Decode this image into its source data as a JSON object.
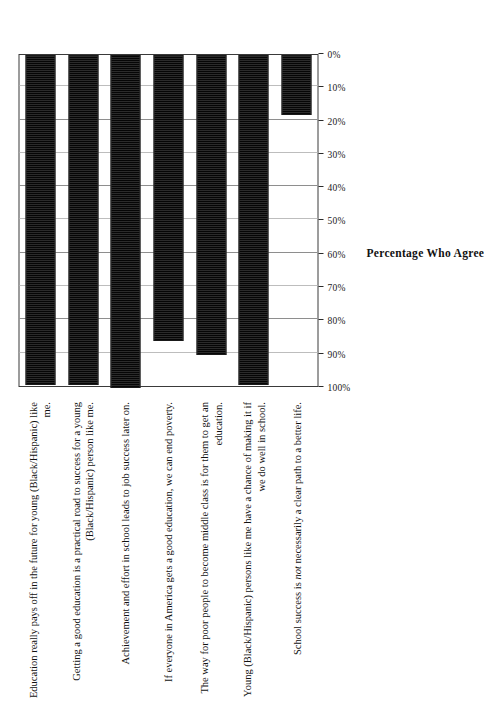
{
  "chart_data": {
    "type": "bar",
    "orientation": "vertical-rotated",
    "title": "",
    "xlabel": "",
    "ylabel": "Percentage Who Agree",
    "ylim": [
      0,
      100
    ],
    "grid": true,
    "legend": "none",
    "tick_labels": [
      "0%",
      "10%",
      "20%",
      "30%",
      "40%",
      "50%",
      "60%",
      "70%",
      "80%",
      "90%",
      "100%"
    ],
    "tick_values": [
      0,
      10,
      20,
      30,
      40,
      50,
      60,
      70,
      80,
      90,
      100
    ],
    "categories": [
      "Education really pays off in the future for young (Black/Hispanic) like me.",
      "Getting a good education is a practical road to success for a young (Black/Hispanic) person like me.",
      "Achievement and effort in school leads to job success later on.",
      "If everyone in America gets a good education, we can end poverty.",
      "The way for poor people to become middle class is for them to get an education.",
      "Young (Black/Hispanic) persons like me have a chance of making it if we do well in school.",
      "School success is not necessarily a clear path to a better life."
    ],
    "values": [
      99,
      99,
      100,
      86,
      90,
      99,
      18
    ],
    "bar_color": "#4a4a4a",
    "bar_edge_color": "#1a1a1a"
  },
  "axis": {
    "title": "Percentage Who Agree",
    "ticks": [
      {
        "label": "0%",
        "value": 0
      },
      {
        "label": "10%",
        "value": 10
      },
      {
        "label": "20%",
        "value": 20
      },
      {
        "label": "30%",
        "value": 30
      },
      {
        "label": "40%",
        "value": 40
      },
      {
        "label": "50%",
        "value": 50
      },
      {
        "label": "60%",
        "value": 60
      },
      {
        "label": "70%",
        "value": 70
      },
      {
        "label": "80%",
        "value": 80
      },
      {
        "label": "90%",
        "value": 90
      },
      {
        "label": "100%",
        "value": 100
      }
    ]
  },
  "categories": [
    {
      "id": "education-pays-off",
      "segments": [
        {
          "text": "Education really pays off in the future for young (Black/Hispanic) like me.",
          "italic": false
        }
      ],
      "value": 99
    },
    {
      "id": "good-education-practical-road",
      "segments": [
        {
          "text": "Getting a good education is a practical road to success for a young (Black/Hispanic) person like me.",
          "italic": false
        }
      ],
      "value": 99
    },
    {
      "id": "achievement-effort-job-success",
      "segments": [
        {
          "text": "Achievement and effort in school leads to job success later on.",
          "italic": false
        }
      ],
      "value": 100
    },
    {
      "id": "education-end-poverty",
      "segments": [
        {
          "text": "If everyone in America gets a good education, we can end poverty.",
          "italic": false
        }
      ],
      "value": 86
    },
    {
      "id": "poor-to-middle-class",
      "segments": [
        {
          "text": "The way for poor people to become middle class is for them to get an education.",
          "italic": false
        }
      ],
      "value": 90
    },
    {
      "id": "chance-of-making-it",
      "segments": [
        {
          "text": "Young (Black/Hispanic) persons like me have a chance of making it if we do well in school.",
          "italic": false
        }
      ],
      "value": 99
    },
    {
      "id": "school-success-not-clear-path",
      "segments": [
        {
          "text": "School success is ",
          "italic": false
        },
        {
          "text": "not",
          "italic": true
        },
        {
          "text": " necessarily a clear path to a better life.",
          "italic": false
        }
      ],
      "value": 18
    }
  ]
}
